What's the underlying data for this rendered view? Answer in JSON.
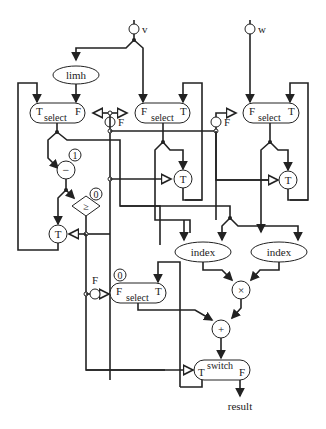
{
  "diagram": {
    "type": "dataflow-graph",
    "inputs": [
      {
        "id": "v",
        "label": "v"
      },
      {
        "id": "w",
        "label": "w"
      }
    ],
    "output": {
      "id": "result",
      "label": "result"
    },
    "nodes": {
      "limh": {
        "label": "limh"
      },
      "select1": {
        "label": "select",
        "left": "T",
        "right": "F"
      },
      "select2": {
        "label": "select",
        "left": "F",
        "right": "T"
      },
      "select3": {
        "label": "select",
        "left": "F",
        "right": "T"
      },
      "select4": {
        "label": "select",
        "left": "F",
        "right": "T",
        "init": "0"
      },
      "init_F1": {
        "label": "F"
      },
      "init_F2": {
        "label": "F"
      },
      "init_F3": {
        "label": "F"
      },
      "minus": {
        "label": "−",
        "const": "1"
      },
      "geq": {
        "label": "≥",
        "const": "0"
      },
      "gateT1": {
        "label": "T"
      },
      "gateT2": {
        "label": "T"
      },
      "gateT3": {
        "label": "T"
      },
      "index1": {
        "label": "index"
      },
      "index2": {
        "label": "index"
      },
      "times": {
        "label": "×"
      },
      "plus": {
        "label": "+"
      },
      "switch": {
        "label": "switch",
        "left": "T",
        "right": "F"
      }
    }
  }
}
